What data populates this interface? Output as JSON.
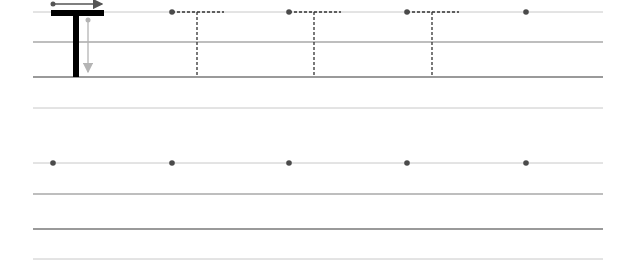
{
  "worksheet": {
    "letter": "T",
    "colors": {
      "line_light": "#c8c8c8",
      "line_mid": "#a8a8a8",
      "line_dark": "#9a9a9a",
      "letter": "#000000",
      "guide_arrow": "#555555",
      "stem_arrow": "#b4b4b4",
      "dot": "#4a4a4a",
      "dashed": "#333333"
    },
    "rows": [
      {
        "lines_y": [
          12,
          42,
          77,
          108
        ],
        "dots_x": [
          172,
          289,
          407,
          526
        ],
        "traced_x": [
          172,
          289,
          407
        ]
      },
      {
        "lines_y": [
          163,
          194,
          229,
          259
        ],
        "dots_x": [
          53,
          172,
          289,
          407,
          526
        ],
        "traced_x": []
      }
    ]
  }
}
